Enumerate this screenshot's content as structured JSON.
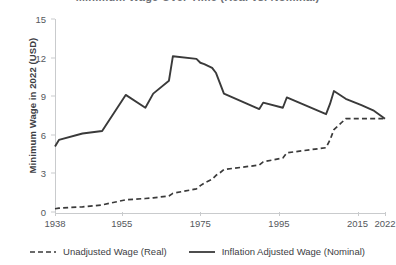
{
  "title_sliver": "Minimum Wage Over Time (Real vs. Nominal)",
  "axes": {
    "ylabel": "Minimum Wage in 2022 (USD)",
    "xlabel": "",
    "yticks": [
      "0",
      "3",
      "6",
      "9",
      "12",
      "15"
    ],
    "xticks": [
      "1938",
      "1955",
      "1975",
      "1995",
      "2015",
      "2022"
    ]
  },
  "legend": {
    "items": [
      {
        "label": "Unadjusted Wage (Real)",
        "style": "dashed",
        "color": "#3a3a3a",
        "icon": "dashed-line-icon"
      },
      {
        "label": "Inflation Adjusted Wage (Nominal)",
        "style": "solid",
        "color": "#3a3a3a",
        "icon": "solid-line-icon"
      }
    ]
  },
  "chart_data": {
    "type": "line",
    "title": "Minimum Wage Over Time (Real vs. Nominal)",
    "xlabel": "",
    "ylabel": "Minimum Wage in 2022 (USD)",
    "xlim": [
      1938,
      2022
    ],
    "ylim": [
      0,
      15
    ],
    "yticks": [
      0,
      3,
      6,
      9,
      12,
      15
    ],
    "xticks": [
      1938,
      1955,
      1975,
      1995,
      2015,
      2022
    ],
    "grid": false,
    "legend_position": "bottom",
    "x": [
      1938,
      1939,
      1945,
      1950,
      1956,
      1961,
      1963,
      1967,
      1968,
      1974,
      1975,
      1976,
      1978,
      1979,
      1980,
      1981,
      1990,
      1991,
      1996,
      1997,
      2007,
      2008,
      2009,
      2012,
      2016,
      2019,
      2022
    ],
    "series": [
      {
        "name": "Inflation Adjusted Wage (Nominal)",
        "style": "solid",
        "color": "#3a3a3a",
        "values": [
          5.1,
          5.6,
          6.1,
          6.3,
          9.1,
          8.1,
          9.2,
          10.2,
          12.1,
          11.9,
          11.6,
          11.5,
          11.2,
          10.8,
          10.0,
          9.2,
          8.0,
          8.5,
          8.1,
          8.9,
          7.6,
          8.4,
          9.4,
          8.8,
          8.3,
          7.9,
          7.25
        ]
      },
      {
        "name": "Unadjusted Wage (Real)",
        "style": "dashed",
        "color": "#3a3a3a",
        "values": [
          0.25,
          0.3,
          0.4,
          0.55,
          0.95,
          1.05,
          1.1,
          1.25,
          1.45,
          1.8,
          2.05,
          2.25,
          2.55,
          2.85,
          3.05,
          3.3,
          3.65,
          3.9,
          4.2,
          4.6,
          5.0,
          5.6,
          6.4,
          7.25,
          7.25,
          7.25,
          7.25
        ]
      }
    ]
  }
}
